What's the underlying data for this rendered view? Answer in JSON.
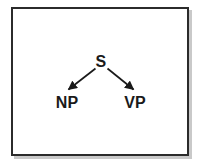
{
  "figure": {
    "type": "syntax-tree-diagram",
    "caption": "",
    "frame": {
      "border_color": "#2b2b2b",
      "shadow_color": "#c9c9c9",
      "background_color": "#ffffff"
    }
  },
  "tree": {
    "root": {
      "id": "s",
      "label": "S"
    },
    "children": [
      {
        "id": "np",
        "label": "NP"
      },
      {
        "id": "vp",
        "label": "VP"
      }
    ],
    "edges": [
      {
        "id": "edge-s-np",
        "from": "S",
        "to": "NP",
        "arrowhead": "filled-triangle",
        "direction": "down-left",
        "color": "#1a1a1a"
      },
      {
        "id": "edge-s-vp",
        "from": "S",
        "to": "VP",
        "arrowhead": "filled-triangle",
        "direction": "down-right",
        "color": "#1a1a1a"
      }
    ],
    "label_color": "#1a1a1a"
  }
}
